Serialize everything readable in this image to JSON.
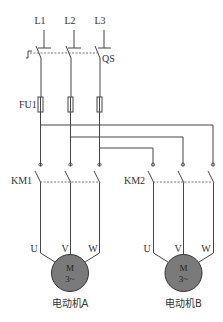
{
  "diagram": {
    "type": "electrical-schematic",
    "phases": {
      "L1": "L1",
      "L2": "L2",
      "L3": "L3"
    },
    "isolator": {
      "label": "QS"
    },
    "fuses": {
      "label": "FU1"
    },
    "contactors": {
      "a": {
        "label": "KM1"
      },
      "b": {
        "label": "KM2"
      }
    },
    "terminals": {
      "u": "U",
      "v": "V",
      "w": "W"
    },
    "motors": {
      "a": {
        "symbol": "M",
        "phase": "3~",
        "caption": "电动机A"
      },
      "b": {
        "symbol": "M",
        "phase": "3~",
        "caption": "电动机B"
      }
    },
    "colors": {
      "wire": "#444444",
      "motor_fill": "#7a7a7a",
      "motor_stroke": "#333333",
      "background": "#ffffff"
    }
  }
}
